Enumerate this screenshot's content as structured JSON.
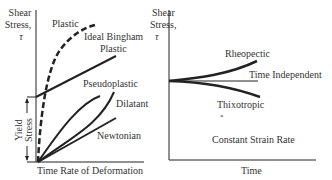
{
  "left_chart": {
    "y_axis_label": [
      "Shear",
      "Stress,",
      "τ"
    ],
    "x_axis_label": "Time Rate of Deformation",
    "yield_label": [
      "Yield",
      "Stress"
    ],
    "curves": {
      "plastic": "Plastic",
      "bingham_1": "Ideal Bingham",
      "bingham_2": "Plastic",
      "pseudoplastic": "Pseudoplastic",
      "dilatant": "Dilatant",
      "newtonian": "Newtonian"
    }
  },
  "right_chart": {
    "y_axis_label": [
      "Shear",
      "Stress,",
      "τ"
    ],
    "x_axis_label": "Time",
    "curves": {
      "rheopectic": "Rheopectic",
      "time_independent": "Time Independent",
      "thixotropic": "Thixotropic"
    },
    "note": "Constant Strain Rate",
    "marker": "*"
  },
  "colors": {
    "line": "#222222",
    "text": "#333333",
    "background": "#ffffff"
  }
}
